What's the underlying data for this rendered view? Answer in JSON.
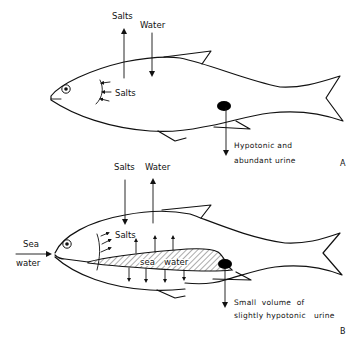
{
  "figure": {
    "panels": [
      {
        "id": "A",
        "panel_label": "A",
        "description": "Freshwater fish",
        "labels": {
          "salts_out": "Salts",
          "water_in": "Water",
          "gill_salts": "Salts",
          "urine_line1": "Hypotonic and",
          "urine_line2": "abundant urine"
        }
      },
      {
        "id": "B",
        "panel_label": "B",
        "description": "Marine fish",
        "labels": {
          "salts_in": "Salts",
          "water_out": "Water",
          "sea_word": "Sea",
          "water_word": "water",
          "gill_salts": "Salts",
          "gut_sea": "sea",
          "gut_water": "water",
          "urine_line1": "Small  volume  of",
          "urine_line2": "slightly hypotonic   urine"
        }
      }
    ],
    "colors": {
      "line": "#111111",
      "background": "#ffffff",
      "kidney": "#000000"
    }
  }
}
